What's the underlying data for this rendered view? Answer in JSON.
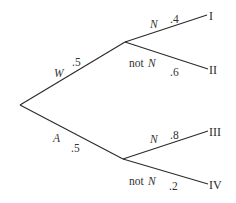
{
  "diagram": {
    "type": "probability-tree",
    "root": {
      "x": 20,
      "y": 105
    },
    "first_level": [
      {
        "event": "W",
        "probability": ".5",
        "node": {
          "x": 125,
          "y": 42
        },
        "children": [
          {
            "event": "N",
            "probability": ".4",
            "outcome": "I",
            "end": {
              "x": 207,
              "y": 15
            }
          },
          {
            "event_prefix": "not",
            "event": "N",
            "probability": ".6",
            "outcome": "II",
            "end": {
              "x": 208,
              "y": 69
            }
          }
        ]
      },
      {
        "event": "A",
        "probability": ".5",
        "node": {
          "x": 123,
          "y": 159
        },
        "children": [
          {
            "event": "N",
            "probability": ".8",
            "outcome": "III",
            "end": {
              "x": 208,
              "y": 131
            }
          },
          {
            "event_prefix": "not",
            "event": "N",
            "probability": ".2",
            "outcome": "IV",
            "end": {
              "x": 208,
              "y": 184
            }
          }
        ]
      }
    ],
    "colors": {
      "line": "#2a2a2a",
      "text": "#333333",
      "background": "#ffffff"
    }
  }
}
